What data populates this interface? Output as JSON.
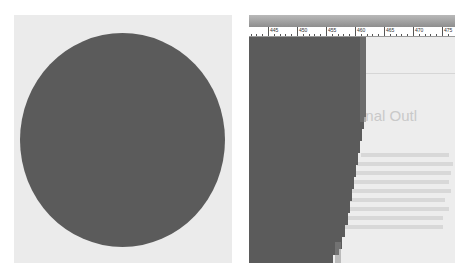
{
  "left_panel": {
    "shape": "filled-circle",
    "fill_color": "#5b5b5b",
    "background_color": "#ebebeb"
  },
  "right_panel": {
    "ruler": {
      "labels": [
        "445",
        "450",
        "455",
        "460",
        "465",
        "470",
        "475"
      ]
    },
    "background_text": {
      "heading": "onal Outl"
    },
    "fill_color": "#5b5b5b",
    "background_color": "#ededed"
  }
}
